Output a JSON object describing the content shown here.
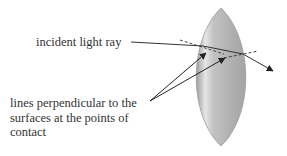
{
  "diagram": {
    "labels": {
      "incident": "incident light ray",
      "normals_line1": "lines perpendicular to the",
      "normals_line2": "surfaces at the points of",
      "normals_line3": "contact"
    },
    "colors": {
      "lens_edge": "#9a9a9a",
      "lens_body": "#b5b5b5",
      "lens_highlight": "#e8e8e8",
      "ray": "#333333",
      "text": "#333333"
    }
  }
}
